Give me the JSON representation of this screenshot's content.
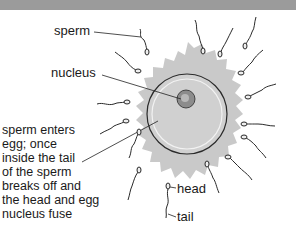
{
  "diagram": {
    "labels": {
      "sperm": "sperm",
      "nucleus": "nucleus",
      "head": "head",
      "tail": "tail"
    },
    "description_lines": [
      "sperm enters",
      "egg; once",
      "inside the tail",
      "of the sperm",
      "breaks off and",
      "the head and egg",
      "nucleus fuse"
    ],
    "colors": {
      "top_band": "#9b9b9b",
      "corona": "#c9c9c9",
      "egg_fill": "#d0d0d0",
      "egg_stroke": "#2a2a2a",
      "inner_ring": "#f2f2f2",
      "nucleus_fill": "#8c8c8c",
      "nucleus_core": "#b8b8b8",
      "line": "#222222"
    }
  }
}
